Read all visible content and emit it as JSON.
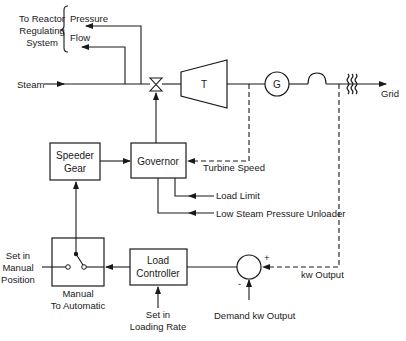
{
  "diagram": {
    "reactor_group": {
      "label_line1": "To Reactor",
      "label_line2": "Regulating",
      "label_line3": "System",
      "signals": [
        "Pressure",
        "Flow"
      ]
    },
    "steam_label": "Steam",
    "turbine_label": "T",
    "generator_label": "G",
    "grid_label": "Grid",
    "speeder_gear": {
      "line1": "Speeder",
      "line2": "Gear"
    },
    "governor": {
      "label": "Governor"
    },
    "turbine_speed_label": "Turbine Speed",
    "load_limit_label": "Load Limit",
    "low_steam_label": "Low Steam Pressure Unloader",
    "manual_position": {
      "line1": "Set in",
      "line2": "Manual",
      "line3": "Position"
    },
    "switch_label": {
      "line1": "Manual",
      "line2": "To Automatic"
    },
    "load_controller": {
      "line1": "Load",
      "line2": "Controller"
    },
    "loading_rate": {
      "line1": "Set in",
      "line2": "Loading Rate"
    },
    "summer": {
      "plus": "+",
      "minus": "-"
    },
    "kw_output_label": "kw Output",
    "demand_label": "Demand kw Output"
  }
}
